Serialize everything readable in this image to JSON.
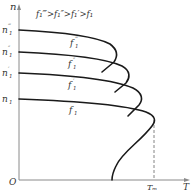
{
  "diagram": {
    "title_relation": "f₁‴>f₁″>f₁′>f₁",
    "axes": {
      "y_label": "n",
      "x_label": "T",
      "origin_label": "O",
      "x_mark_label": "Tₘ"
    },
    "speed_labels": [
      {
        "main": "n",
        "sup": "‴",
        "sub": "1"
      },
      {
        "main": "n",
        "sup": "″",
        "sub": "1"
      },
      {
        "main": "n",
        "sup": "′",
        "sub": "1"
      },
      {
        "main": "n",
        "sup": "",
        "sub": "1"
      }
    ],
    "curve_labels": [
      {
        "main": "f",
        "sup": "‴",
        "sub": "1"
      },
      {
        "main": "f",
        "sup": "″",
        "sub": "1"
      },
      {
        "main": "f",
        "sup": "′",
        "sub": "1"
      },
      {
        "main": "f",
        "sup": "",
        "sub": "1"
      }
    ],
    "colors": {
      "curve": "#1a1a1a",
      "axis": "#8a8a8a",
      "text": "#333333"
    }
  }
}
